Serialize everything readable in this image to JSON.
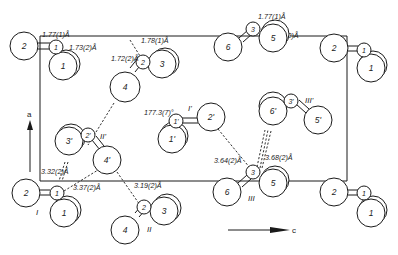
{
  "diagram": {
    "type": "crystal packing projection",
    "axes": {
      "vertical": "a",
      "horizontal": "c"
    },
    "molecule_labels": [
      "I",
      "II",
      "III",
      "I'",
      "II'",
      "III'"
    ],
    "atoms": {
      "mol_I_top": [
        "2",
        "1",
        "1"
      ],
      "mol_II_top": [
        "4",
        "2",
        "3"
      ],
      "mol_III_top": [
        "6",
        "3",
        "5"
      ],
      "mol_I_right_top": [
        "2",
        "1",
        "1"
      ],
      "mol_I_prime": [
        "2'",
        "1'",
        "1'"
      ],
      "mol_II_prime": [
        "4'",
        "2'",
        "3'"
      ],
      "mol_III_prime": [
        "6'",
        "3'",
        "5'"
      ],
      "mol_I_bottom": [
        "2",
        "1",
        "1"
      ],
      "mol_II_bottom": [
        "4",
        "2",
        "3"
      ],
      "mol_III_bottom": [
        "6",
        "3",
        "5"
      ],
      "mol_I_right_bottom": [
        "2",
        "1",
        "1"
      ]
    },
    "bond_lengths": [
      "1.77(1)Å",
      "1.73(2)Å",
      "1.78(1)Å",
      "1.72(2)Å",
      "1.71(2)Å",
      "1.77(1)Å"
    ],
    "contacts": [
      "3.32(2)Å",
      "3.37(2)Å",
      "3.19(2)Å",
      "3.64(2)Å",
      "3.68(2)Å"
    ],
    "angle": "177.3(7)°"
  }
}
